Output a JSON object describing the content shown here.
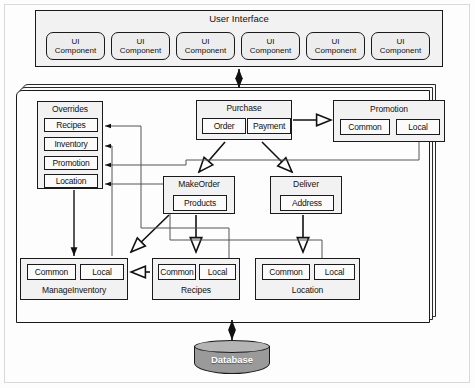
{
  "diagram": {
    "colors": {
      "node_fill": "#f2f2f2",
      "slot_fill": "#fbfbfb",
      "stroke": "#1a1a1a",
      "database_fill": "#9a9a9a",
      "database_top": "#b4b4b4",
      "database_text": "#ffffff"
    }
  },
  "ui_layer": {
    "title": "User Interface",
    "components": [
      {
        "line1": "UI",
        "line2": "Component"
      },
      {
        "line1": "UI",
        "line2": "Component"
      },
      {
        "line1": "UI",
        "line2": "Component"
      },
      {
        "line1": "UI",
        "line2": "Component"
      },
      {
        "line1": "UI",
        "line2": "Component"
      },
      {
        "line1": "UI",
        "line2": "Component"
      }
    ]
  },
  "service_layer": {
    "overrides": {
      "title": "Overrides",
      "items": [
        "Recipes",
        "Inventory",
        "Promotion",
        "Location"
      ]
    },
    "purchase": {
      "title": "Purchase",
      "items": [
        "Order",
        "Payment"
      ]
    },
    "promotion": {
      "title": "Promotion",
      "items": [
        "Common",
        "Local"
      ]
    },
    "makeorder": {
      "title": "MakeOrder",
      "items": [
        "Products"
      ]
    },
    "deliver": {
      "title": "Deliver",
      "items": [
        "Address"
      ]
    },
    "manage_inventory": {
      "title": "ManageInventory",
      "items": [
        "Common",
        "Local"
      ]
    },
    "recipes": {
      "title": "Recipes",
      "items": [
        "Common",
        "Local"
      ]
    },
    "location": {
      "title": "Location",
      "items": [
        "Common",
        "Local"
      ]
    }
  },
  "data_layer": {
    "database": {
      "label": "Database"
    }
  }
}
